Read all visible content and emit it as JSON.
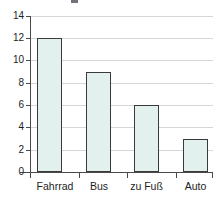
{
  "chart_data": {
    "type": "bar",
    "title": "",
    "subtitle": "",
    "xlabel": "",
    "ylabel": "",
    "categories": [
      "Fahrrad",
      "Bus",
      "zu Fuß",
      "Auto"
    ],
    "values": [
      12,
      9,
      6,
      3
    ],
    "ylim": [
      0,
      14
    ],
    "y_ticks": [
      0,
      2,
      4,
      6,
      8,
      10,
      12,
      14
    ],
    "y_tick_labels": [
      "0",
      "2",
      "4",
      "6",
      "8",
      "10",
      "12",
      "14"
    ],
    "grid": true,
    "grid_axis": "y",
    "legend": false,
    "legend_position": "none",
    "annotations": []
  },
  "style": {
    "bar_fill": "#e2f0ee",
    "bar_border": "#3a3a3a",
    "gridline_color": "#d6d6d6",
    "axis_color": "#4a4a4a",
    "text_color": "#1d1d1d",
    "background": "#ffffff"
  }
}
